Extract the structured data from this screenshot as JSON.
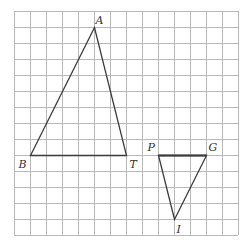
{
  "grid": {
    "origin_x": 14,
    "origin_y": 11,
    "cell": 16,
    "cols": 14,
    "rows": 14,
    "line_color": "#b8b8b8"
  },
  "triangles": [
    {
      "name": "triangle-abt",
      "vertices": [
        {
          "label": "A",
          "col": 5,
          "row": 1,
          "label_dx": 1,
          "label_dy": -4
        },
        {
          "label": "B",
          "col": 1,
          "row": 9,
          "label_dx": -12,
          "label_dy": 12
        },
        {
          "label": "T",
          "col": 7,
          "row": 9,
          "label_dx": 3,
          "label_dy": 12
        }
      ],
      "stroke": "#3a3a3a"
    },
    {
      "name": "triangle-pgi",
      "vertices": [
        {
          "label": "P",
          "col": 9,
          "row": 9,
          "label_dx": -11,
          "label_dy": -5
        },
        {
          "label": "G",
          "col": 12,
          "row": 9,
          "label_dx": 2,
          "label_dy": -5
        },
        {
          "label": "I",
          "col": 10,
          "row": 13,
          "label_dx": 2,
          "label_dy": 13
        }
      ],
      "stroke": "#3a3a3a"
    }
  ],
  "labels": {
    "A": "A",
    "B": "B",
    "T": "T",
    "P": "P",
    "G": "G",
    "I": "I"
  }
}
